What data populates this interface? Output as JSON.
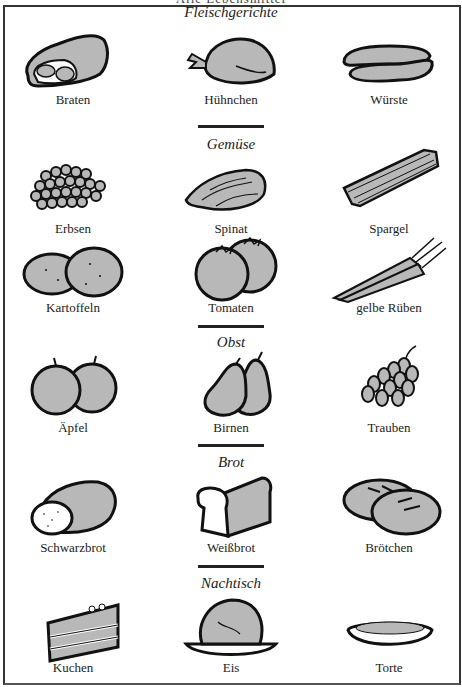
{
  "page": {
    "clipped_heading": "Alle Lebensmittel",
    "colors": {
      "ink": "#1a1a1a",
      "fill": "#b8b8b8",
      "paper": "#ffffff",
      "border": "#333333"
    }
  },
  "sections": [
    {
      "title": "Fleischgerichte",
      "items": [
        {
          "label": "Braten",
          "icon": "roast-meat-icon"
        },
        {
          "label": "Hühnchen",
          "icon": "chicken-icon"
        },
        {
          "label": "Würste",
          "icon": "sausages-icon"
        }
      ]
    },
    {
      "title": "Gemüse",
      "items": [
        {
          "label": "Erbsen",
          "icon": "peas-icon"
        },
        {
          "label": "Spinat",
          "icon": "spinach-icon"
        },
        {
          "label": "Spargel",
          "icon": "asparagus-icon"
        },
        {
          "label": "Kartoffeln",
          "icon": "potatoes-icon"
        },
        {
          "label": "Tomaten",
          "icon": "tomatoes-icon"
        },
        {
          "label": "gelbe Rüben",
          "icon": "carrots-icon"
        }
      ]
    },
    {
      "title": "Obst",
      "items": [
        {
          "label": "Äpfel",
          "icon": "apples-icon"
        },
        {
          "label": "Birnen",
          "icon": "pears-icon"
        },
        {
          "label": "Trauben",
          "icon": "grapes-icon"
        }
      ]
    },
    {
      "title": "Brot",
      "items": [
        {
          "label": "Schwarzbrot",
          "icon": "dark-bread-icon"
        },
        {
          "label": "Weißbrot",
          "icon": "white-bread-icon"
        },
        {
          "label": "Brötchen",
          "icon": "bread-rolls-icon"
        }
      ]
    },
    {
      "title": "Nachtisch",
      "items": [
        {
          "label": "Kuchen",
          "icon": "cake-icon"
        },
        {
          "label": "Eis",
          "icon": "ice-cream-icon"
        },
        {
          "label": "Torte",
          "icon": "pie-icon"
        }
      ]
    }
  ]
}
